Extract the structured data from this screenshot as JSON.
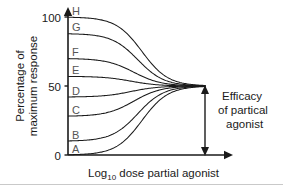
{
  "chart_data": {
    "type": "line",
    "title": "",
    "xlabel": "Log10 dose partial agonist",
    "xlabel_base": "Log",
    "xlabel_sub": "10",
    "xlabel_rest": " dose partial agonist",
    "ylabel_line1": "Percentage of",
    "ylabel_line2": "maximum response",
    "ylim": [
      0,
      100
    ],
    "xlim": [
      0,
      10
    ],
    "yticks": [
      0,
      50,
      100
    ],
    "ytick_labels": [
      "0",
      "50",
      "100"
    ],
    "xticks": [],
    "xtick_labels": [],
    "grid": false,
    "legend": "inline-curve-labels",
    "convergence_value": 50,
    "series": [
      {
        "name": "A",
        "label": "A",
        "start": 0,
        "end": 50,
        "x_mid": 5.4,
        "steepness": 1.05
      },
      {
        "name": "B",
        "label": "B",
        "start": 10,
        "end": 50,
        "x_mid": 5.1,
        "steepness": 1.05
      },
      {
        "name": "C",
        "label": "C",
        "start": 28,
        "end": 50,
        "x_mid": 4.8,
        "steepness": 1.0
      },
      {
        "name": "D",
        "label": "D",
        "start": 42,
        "end": 50,
        "x_mid": 4.6,
        "steepness": 1.0
      },
      {
        "name": "E",
        "label": "E",
        "start": 57,
        "end": 50,
        "x_mid": 4.6,
        "steepness": 1.0
      },
      {
        "name": "F",
        "label": "F",
        "start": 70,
        "end": 50,
        "x_mid": 4.8,
        "steepness": 1.0
      },
      {
        "name": "G",
        "label": "G",
        "start": 88,
        "end": 50,
        "x_mid": 5.1,
        "steepness": 1.05
      },
      {
        "name": "H",
        "label": "H",
        "start": 100,
        "end": 50,
        "x_mid": 5.4,
        "steepness": 1.05
      }
    ],
    "annotations": [
      {
        "name": "efficacy-bracket",
        "kind": "double-headed-vertical-arrow",
        "from_value": 0,
        "to_value": 50,
        "text_line1": "Efficacy",
        "text_line2": "of partical",
        "text_line3": "agonist"
      }
    ],
    "colors": {
      "curve": "#1a1a1a",
      "axis": "#1a1a1a",
      "text": "#1a1a1a",
      "curve_label": "#555555",
      "background": "#ffffff"
    }
  },
  "axes": {
    "y_label_line1": "Percentage of",
    "y_label_line2": "maximum response",
    "y_tick_100": "100",
    "y_tick_50": "50",
    "y_tick_0": "0",
    "x_label_prefix": "Log",
    "x_label_subscript": "10",
    "x_label_suffix": " dose partial agonist"
  },
  "curve_labels": {
    "a": "A",
    "b": "B",
    "c": "C",
    "d": "D",
    "e": "E",
    "f": "F",
    "g": "G",
    "h": "H"
  },
  "annotation": {
    "line1": "Efficacy",
    "line2": "of partical",
    "line3": "agonist"
  }
}
